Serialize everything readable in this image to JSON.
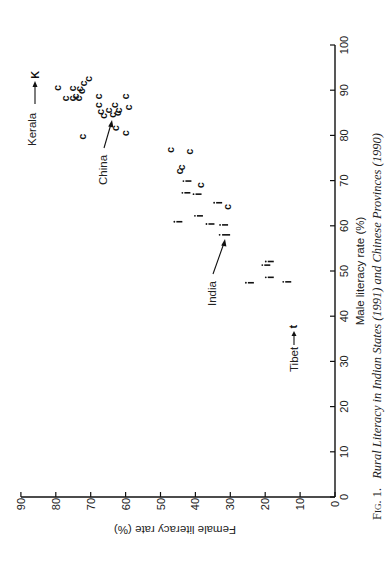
{
  "figure": {
    "caption_prefix": "Fig. 1.",
    "caption_title": "Rural Literacy in Indian States (1991) and Chinese Provinces (1990)"
  },
  "chart_data": {
    "type": "scatter",
    "title": "Rural Literacy in Indian States (1991) and Chinese Provinces (1990)",
    "figure_label": "Fig. 1.",
    "xlabel": "Male literacy rate (%)",
    "ylabel": "Female literacy rate (%)",
    "xlim": [
      0,
      100
    ],
    "ylim": [
      0,
      90
    ],
    "xticks": [
      "0",
      "10",
      "20",
      "30",
      "40",
      "50",
      "60",
      "70",
      "80",
      "90",
      "100"
    ],
    "yticks": [
      "0",
      "10",
      "20",
      "30",
      "40",
      "50",
      "60",
      "70",
      "80",
      "90"
    ],
    "grid": false,
    "orientation": "page rotated 90 degrees counter-clockwise",
    "series": [
      {
        "name": "Chinese provinces",
        "marker": "c",
        "points": [
          {
            "male": 90.5,
            "female": 79.7
          },
          {
            "male": 90.4,
            "female": 75.4
          },
          {
            "male": 90.3,
            "female": 73.3
          },
          {
            "male": 91.5,
            "female": 72.1
          },
          {
            "male": 92.5,
            "female": 70.7
          },
          {
            "male": 88.2,
            "female": 77.4
          },
          {
            "male": 88.2,
            "female": 75.4
          },
          {
            "male": 88.6,
            "female": 74.5
          },
          {
            "male": 88.2,
            "female": 73.6
          },
          {
            "male": 89.8,
            "female": 72.8
          },
          {
            "male": 79.7,
            "female": 72.6
          },
          {
            "male": 88.6,
            "female": 67.8
          },
          {
            "male": 86.7,
            "female": 68.0
          },
          {
            "male": 85.2,
            "female": 67.3
          },
          {
            "male": 84.3,
            "female": 66.4
          },
          {
            "male": 85.5,
            "female": 65.1
          },
          {
            "male": 86.7,
            "female": 63.2
          },
          {
            "male": 84.9,
            "female": 62.6
          },
          {
            "male": 85.5,
            "female": 62.1
          },
          {
            "male": 88.6,
            "female": 60.2
          },
          {
            "male": 86.2,
            "female": 59.2
          },
          {
            "male": 81.6,
            "female": 63.0
          },
          {
            "male": 80.5,
            "female": 60.2
          },
          {
            "male": 76.8,
            "female": 47.3
          },
          {
            "male": 76.4,
            "female": 41.7
          },
          {
            "male": 72.9,
            "female": 44.2
          },
          {
            "male": 72.0,
            "female": 44.6
          },
          {
            "male": 69.0,
            "female": 38.7
          },
          {
            "male": 64.2,
            "female": 31.0
          }
        ]
      },
      {
        "name": "China (national average)",
        "marker": "C",
        "points": [
          {
            "male": 84.5,
            "female": 64.0
          }
        ]
      },
      {
        "name": "Indian states",
        "marker": "i",
        "points": [
          {
            "male": 69.9,
            "female": 42.0
          },
          {
            "male": 67.3,
            "female": 42.3
          },
          {
            "male": 67.0,
            "female": 39.1
          },
          {
            "male": 65.1,
            "female": 33.2
          },
          {
            "male": 62.2,
            "female": 38.7
          },
          {
            "male": 60.9,
            "female": 44.6
          },
          {
            "male": 60.4,
            "female": 35.4
          },
          {
            "male": 60.2,
            "female": 31.5
          },
          {
            "male": 52.1,
            "female": 18.4
          },
          {
            "male": 51.3,
            "female": 19.4
          },
          {
            "male": 48.6,
            "female": 18.4
          },
          {
            "male": 47.4,
            "female": 24.1
          },
          {
            "male": 47.6,
            "female": 13.4
          }
        ]
      },
      {
        "name": "India (national average)",
        "marker": "I",
        "points": [
          {
            "male": 58.0,
            "female": 31.2
          }
        ]
      },
      {
        "name": "Kerala",
        "marker": "K",
        "points": [
          {
            "male": 93.4,
            "female": 86.0
          }
        ]
      },
      {
        "name": "Tibet",
        "marker": "t",
        "points": [
          {
            "male": 37.7,
            "female": 11.9
          }
        ]
      }
    ],
    "annotations": [
      {
        "text": "Kerala",
        "target": "K"
      },
      {
        "text": "China",
        "target": "C"
      },
      {
        "text": "India",
        "target": "I"
      },
      {
        "text": "Tibet",
        "target": "t"
      }
    ]
  },
  "annotations": {
    "kerala": "Kerala",
    "china": "China",
    "india": "India",
    "tibet": "Tibet"
  },
  "markers": {
    "kerala": "K",
    "tibet": "t"
  }
}
